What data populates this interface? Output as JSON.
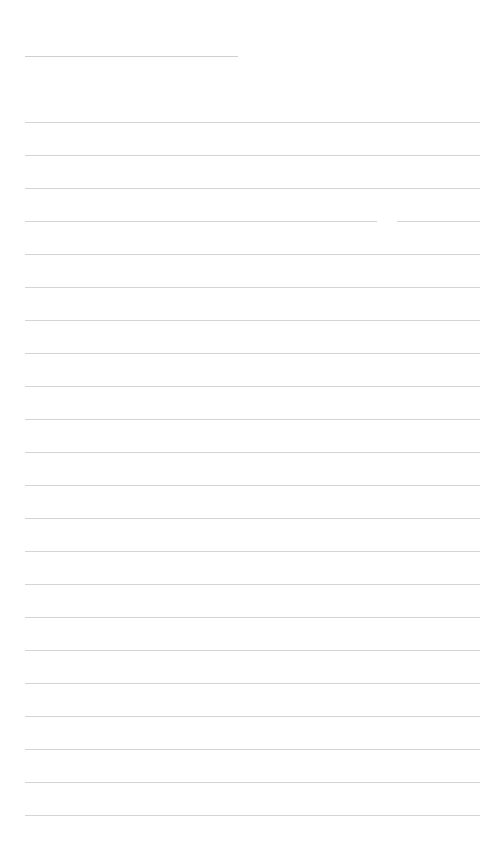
{
  "page": {
    "type": "lined-paper",
    "background": "#ffffff",
    "line_color": "#d4d4d4",
    "title_line": {
      "y": 56,
      "x1": 25,
      "x2": 238
    },
    "first_line_y": 122,
    "line_spacing": 33,
    "line_count": 22,
    "line_x1": 25,
    "line_x2": 480,
    "gaps": [
      {
        "line_index": 3,
        "x1": 377,
        "x2": 397
      }
    ]
  }
}
